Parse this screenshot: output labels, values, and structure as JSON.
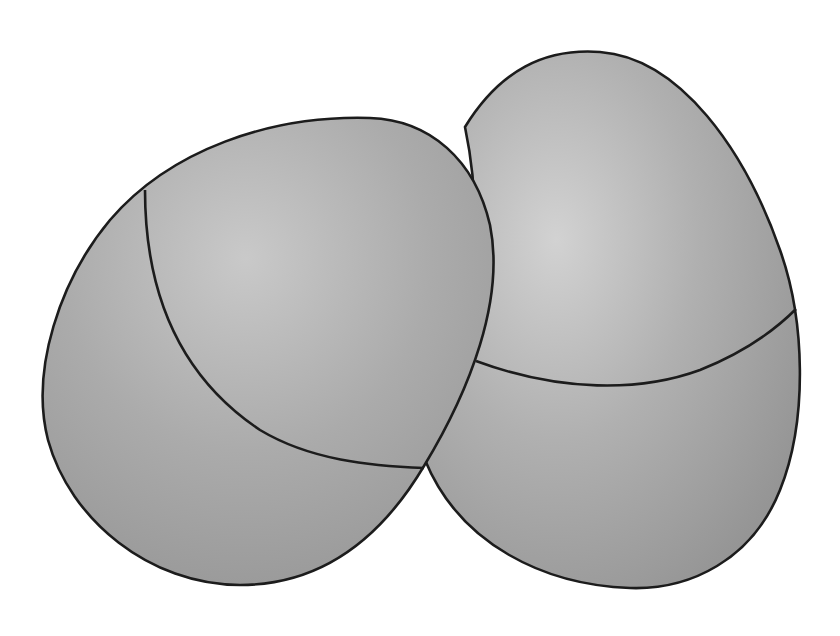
{
  "image": {
    "description": "Two overlapping gray eggs, each divided by a curved line",
    "width": 840,
    "height": 636,
    "background": "#ffffff"
  },
  "colors": {
    "outline": "#1c1c1c",
    "fill_light": "#cdcdcd",
    "fill_mid": "#ababab",
    "fill_dark": "#9a9a9a"
  },
  "eggs": [
    {
      "id": "left-egg",
      "label": "Left egg",
      "divider": "curved arc from upper-left edge sweeping down to the junction with the right egg"
    },
    {
      "id": "right-egg",
      "label": "Right egg",
      "divider": "curved arc across the middle from left edge to right edge"
    }
  ]
}
